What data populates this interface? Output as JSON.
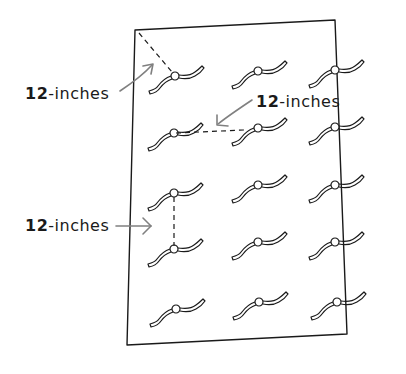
{
  "diagram": {
    "colors": {
      "ink": "#1a1a1a",
      "arrow": "#808080",
      "background": "#ffffff"
    },
    "grid": {
      "rows": 5,
      "columns": 3
    },
    "labels": [
      {
        "id": "corner",
        "number": "12",
        "text": "-inches",
        "meaning": "distance from sheet corner to first tie"
      },
      {
        "id": "horizontal",
        "number": "12",
        "text": "-inches",
        "meaning": "horizontal spacing between ties"
      },
      {
        "id": "vertical",
        "number": "12",
        "text": "-inches",
        "meaning": "vertical spacing between ties"
      }
    ],
    "icons": [
      "ribbon-tie-icon",
      "arrow-icon",
      "dashed-measure-line"
    ]
  }
}
